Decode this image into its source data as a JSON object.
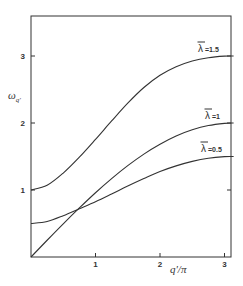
{
  "chart_data": {
    "type": "line",
    "title": "",
    "xlabel": "q'/π",
    "ylabel": "ω_q'",
    "xlim": [
      0,
      3.1416
    ],
    "ylim": [
      0,
      3.5
    ],
    "xticks": [
      "1",
      "2",
      "3"
    ],
    "yticks": [
      "1",
      "2",
      "3"
    ],
    "grid": false,
    "legend": "inline labels at right end of curves",
    "x": [
      0,
      0.25,
      0.5,
      0.75,
      1.0,
      1.25,
      1.5,
      1.75,
      2.0,
      2.25,
      2.5,
      2.75,
      3.0,
      3.1416
    ],
    "series": [
      {
        "name": "λ̄ = 1.5",
        "label_bar": "λ",
        "label_value": "=1.5",
        "values": [
          1.0,
          1.07,
          1.253,
          1.49,
          1.755,
          2.03,
          2.296,
          2.53,
          2.713,
          2.84,
          2.926,
          2.975,
          2.998,
          3.0
        ]
      },
      {
        "name": "λ̄ = 1",
        "label_bar": "λ",
        "label_value": "=1",
        "values": [
          0.0,
          0.25,
          0.495,
          0.732,
          0.959,
          1.17,
          1.363,
          1.536,
          1.683,
          1.806,
          1.898,
          1.962,
          1.995,
          2.0
        ]
      },
      {
        "name": "λ̄ = 0.5",
        "label_bar": "λ",
        "label_value": "=0.5",
        "values": [
          0.5,
          0.53,
          0.616,
          0.72,
          0.825,
          0.94,
          1.058,
          1.17,
          1.276,
          1.36,
          1.427,
          1.474,
          1.498,
          1.5
        ]
      }
    ]
  },
  "axes": {
    "x_label_main": "q'",
    "x_label_div": "/π",
    "y_label_main": "ω",
    "y_label_sub": "q'"
  },
  "colors": {
    "line": "#333333",
    "background": "#ffffff"
  }
}
